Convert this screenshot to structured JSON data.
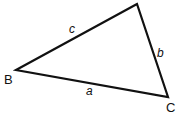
{
  "diagram": {
    "type": "triangle",
    "vertices": {
      "A": {
        "label": "A",
        "x": 137,
        "y": 4
      },
      "B": {
        "label": "B",
        "x": 16,
        "y": 70
      },
      "C": {
        "label": "C",
        "x": 168,
        "y": 97
      }
    },
    "sides": {
      "a": {
        "label": "a"
      },
      "b": {
        "label": "b"
      },
      "c": {
        "label": "c"
      }
    },
    "stroke_color": "#111111"
  }
}
